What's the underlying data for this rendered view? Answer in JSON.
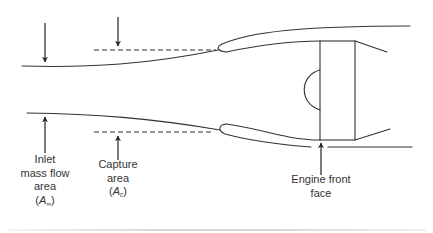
{
  "figure": {
    "type": "inlet-capture-diagram",
    "colors": {
      "stroke": "#333333",
      "text": "#333333",
      "background": "#ffffff",
      "bottom_rule": "#d4d4d4"
    },
    "labels": {
      "inlet_mass_flow": {
        "line1": "Inlet",
        "line2": "mass flow",
        "line3": "area",
        "symbol_open": "(",
        "symbol": "A",
        "subscript": "∞",
        "symbol_close": ")"
      },
      "capture": {
        "line1": "Capture",
        "line2": "area",
        "symbol_open": "(",
        "symbol": "A",
        "subscript": "c",
        "symbol_close": ")"
      },
      "engine_front_face": {
        "line1": "Engine front",
        "line2": "face"
      }
    },
    "arrows": [
      {
        "name": "inlet-mass-flow-top",
        "direction": "down"
      },
      {
        "name": "capture-top",
        "direction": "down"
      },
      {
        "name": "inlet-mass-flow-bottom",
        "direction": "up"
      },
      {
        "name": "capture-bottom",
        "direction": "up"
      },
      {
        "name": "engine-front-face",
        "direction": "up"
      }
    ]
  }
}
